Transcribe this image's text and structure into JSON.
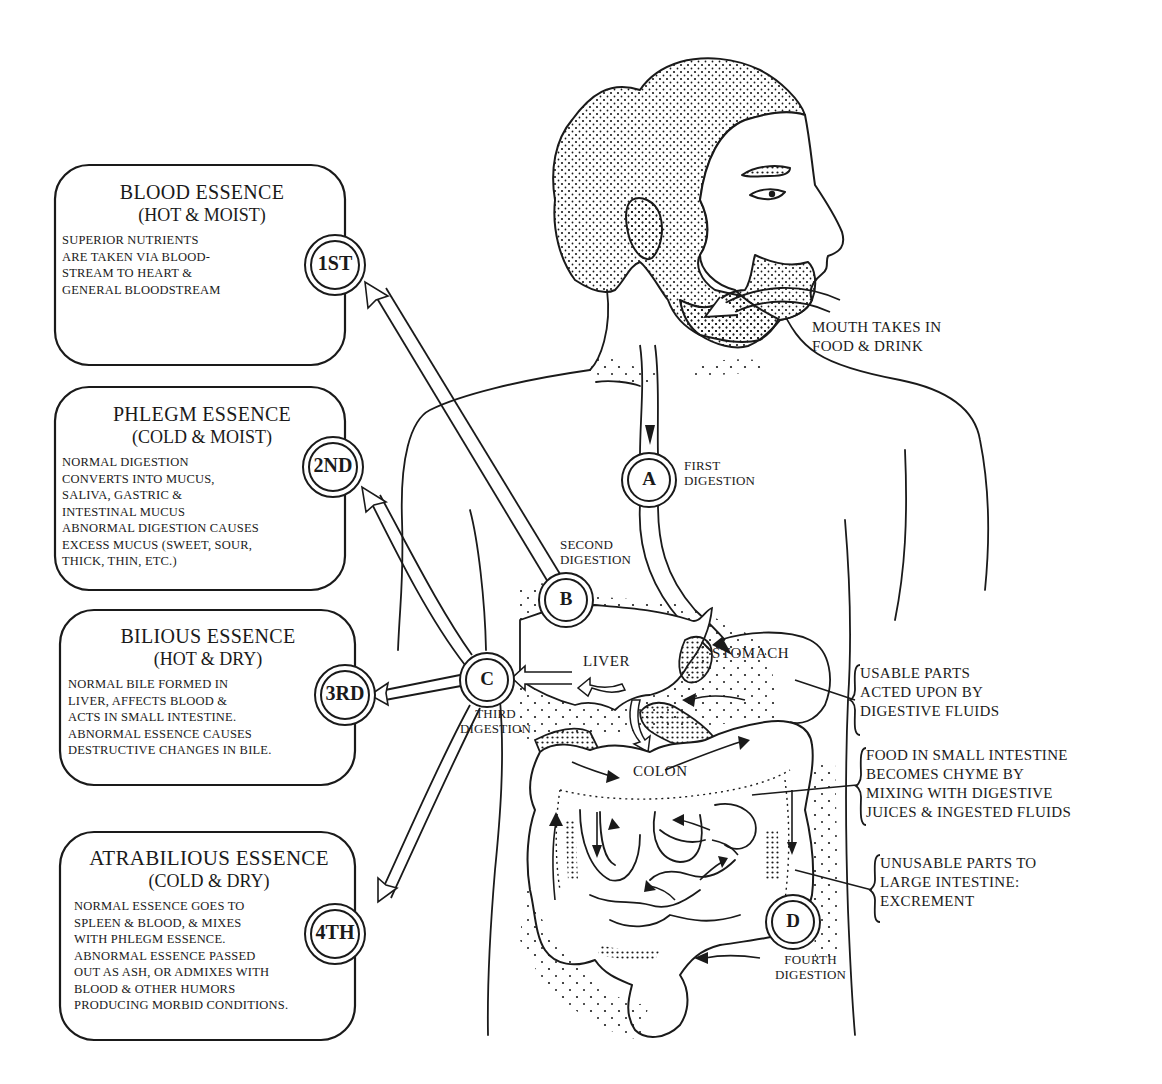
{
  "essences": [
    {
      "title": "BLOOD ESSENCE",
      "qualities": "(HOT & MOIST)",
      "order": "1ST",
      "lines": [
        "SUPERIOR NUTRIENTS",
        "ARE TAKEN VIA BLOOD-",
        "STREAM TO HEART &",
        "GENERAL BLOODSTREAM"
      ]
    },
    {
      "title": "PHLEGM ESSENCE",
      "qualities": "(COLD & MOIST)",
      "order": "2ND",
      "lines": [
        "NORMAL DIGESTION",
        "CONVERTS  INTO MUCUS,",
        "SALIVA, GASTRIC &",
        "INTESTINAL  MUCUS",
        "ABNORMAL DIGESTION  CAUSES",
        "EXCESS MUCUS (SWEET,  SOUR,",
        "THICK, THIN, ETC.)"
      ]
    },
    {
      "title": "BILIOUS ESSENCE",
      "qualities": "(HOT & DRY)",
      "order": "3RD",
      "lines": [
        "NORMAL BILE FORMED IN",
        "LIVER, AFFECTS BLOOD &",
        "ACTS IN SMALL INTESTINE.",
        "ABNORMAL ESSENCE CAUSES",
        "DESTRUCTIVE CHANGES IN BILE."
      ]
    },
    {
      "title": "ATRABILIOUS ESSENCE",
      "qualities": "(COLD & DRY)",
      "order": "4TH",
      "lines": [
        "NORMAL ESSENCE GOES TO",
        "SPLEEN & BLOOD, & MIXES",
        "WITH PHLEGM ESSENCE.",
        "ABNORMAL ESSENCE PASSED",
        "OUT AS ASH, OR ADMIXES WITH",
        "BLOOD & OTHER HUMORS",
        "PRODUCING MORBID CONDITIONS."
      ]
    }
  ],
  "digestion_stages": [
    {
      "letter": "A",
      "label_lines": [
        "FIRST",
        "DIGESTION"
      ]
    },
    {
      "letter": "B",
      "label_lines": [
        "SECOND",
        "DIGESTION"
      ]
    },
    {
      "letter": "C",
      "label_lines": [
        "THIRD",
        "DIGESTION"
      ]
    },
    {
      "letter": "D",
      "label_lines": [
        "FOURTH",
        "DIGESTION"
      ]
    }
  ],
  "organs": {
    "liver": "LIVER",
    "stomach": "STOMACH",
    "colon": "COLON"
  },
  "notes": {
    "mouth": [
      "MOUTH TAKES IN",
      "FOOD & DRINK"
    ],
    "usable": [
      "USABLE PARTS",
      "ACTED UPON BY",
      "DIGESTIVE FLUIDS"
    ],
    "small_intestine": [
      "FOOD IN SMALL INTESTINE",
      "BECOMES CHYME BY",
      "MIXING WITH DIGESTIVE",
      "JUICES & INGESTED FLUIDS"
    ],
    "unusable": [
      "UNUSABLE PARTS TO",
      "LARGE INTESTINE:",
      "EXCREMENT"
    ]
  },
  "colors": {
    "ink": "#1a1a1a",
    "paper": "#ffffff"
  }
}
